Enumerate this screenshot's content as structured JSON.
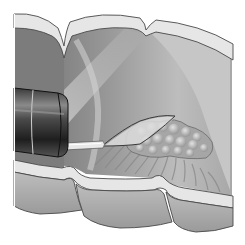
{
  "illustration": {
    "subject": "Endoscopic snare polypectomy in colon (cutaway view)",
    "elements": [
      "colon-wall-cutaway",
      "haustral-folds",
      "endoscope",
      "snare-catheter",
      "snare-loop",
      "polyp-lesion",
      "mucosal-folds"
    ],
    "colors": {
      "background": "#ffffff",
      "wall_outer": "#e6e6e6",
      "wall_cut_face": "#d2d2d2",
      "lumen_dark": "#7a7a7a",
      "lumen_mid": "#9c9c9c",
      "lumen_light": "#c8c8c8",
      "light_beam": "#b4b4b4",
      "scope_dark": "#2a2a2a",
      "scope_mid": "#5a5a5a",
      "polyp": "#b0b0b0",
      "polyp_highlight": "#d8d8d8",
      "outline": "#4a4a4a"
    }
  }
}
